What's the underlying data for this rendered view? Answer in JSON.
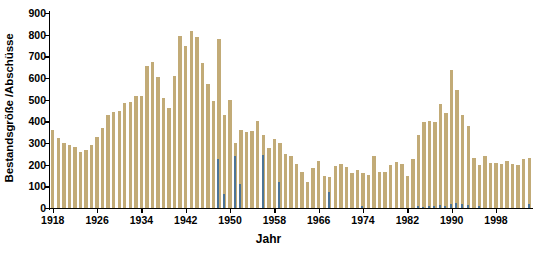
{
  "chart_data": {
    "type": "bar",
    "title": "",
    "subtitle": "",
    "xlabel": "Jahr",
    "ylabel": "Bestandsgröße /Abschüsse",
    "ylim": [
      0,
      900
    ],
    "ytick_step": 100,
    "yticks": [
      0,
      100,
      200,
      300,
      400,
      500,
      600,
      700,
      800,
      900
    ],
    "xlim": [
      1917.5,
      2004.5
    ],
    "xticks": [
      1918,
      1926,
      1934,
      1942,
      1950,
      1958,
      1966,
      1974,
      1982,
      1990,
      1998
    ],
    "xtick_labels": [
      "1918",
      "1926",
      "1934",
      "1942",
      "1950",
      "1958",
      "1966",
      "1974",
      "1982",
      "1990",
      "1998"
    ],
    "grid": false,
    "legend": "none",
    "colors": {
      "primary": "#c2ab77",
      "secondary": "#4c7496",
      "axis": "#000000",
      "background": "#ffffff"
    },
    "categories": [
      1918,
      1919,
      1920,
      1921,
      1922,
      1923,
      1924,
      1925,
      1926,
      1927,
      1928,
      1929,
      1930,
      1931,
      1932,
      1933,
      1934,
      1935,
      1936,
      1937,
      1938,
      1939,
      1940,
      1941,
      1942,
      1943,
      1944,
      1945,
      1946,
      1947,
      1948,
      1949,
      1950,
      1951,
      1952,
      1953,
      1954,
      1955,
      1956,
      1957,
      1958,
      1959,
      1960,
      1961,
      1962,
      1963,
      1964,
      1965,
      1966,
      1967,
      1968,
      1969,
      1970,
      1971,
      1972,
      1973,
      1974,
      1975,
      1976,
      1977,
      1978,
      1979,
      1980,
      1981,
      1982,
      1983,
      1984,
      1985,
      1986,
      1987,
      1988,
      1989,
      1990,
      1991,
      1992,
      1993,
      1994,
      1995,
      1996,
      1997,
      1998,
      1999,
      2000,
      2001,
      2002,
      2003,
      2004
    ],
    "series": [
      {
        "name": "Bestandsgröße",
        "color": "#c2ab77",
        "values": [
          360,
          325,
          298,
          292,
          282,
          258,
          268,
          292,
          330,
          368,
          428,
          443,
          447,
          483,
          488,
          518,
          518,
          655,
          672,
          605,
          508,
          460,
          610,
          795,
          748,
          818,
          788,
          668,
          572,
          492,
          778,
          430,
          498,
          300,
          360,
          350,
          355,
          400,
          338,
          275,
          318,
          300,
          250,
          238,
          205,
          168,
          120,
          185,
          218,
          150,
          142,
          192,
          205,
          190,
          160,
          175,
          160,
          152,
          240,
          165,
          168,
          200,
          212,
          205,
          148,
          225,
          335,
          395,
          400,
          398,
          480,
          438,
          635,
          545,
          428,
          378,
          230,
          200,
          242,
          208,
          210,
          205,
          218,
          205,
          198,
          228,
          230
        ]
      },
      {
        "name": "Abschüsse",
        "color": "#4c7496",
        "values": [
          0,
          0,
          0,
          0,
          0,
          0,
          0,
          0,
          0,
          0,
          0,
          0,
          0,
          0,
          0,
          0,
          0,
          0,
          0,
          0,
          0,
          0,
          0,
          0,
          0,
          0,
          0,
          0,
          0,
          0,
          228,
          65,
          0,
          240,
          112,
          0,
          0,
          0,
          245,
          0,
          0,
          118,
          0,
          0,
          0,
          0,
          0,
          0,
          0,
          0,
          72,
          0,
          0,
          0,
          0,
          0,
          10,
          0,
          0,
          0,
          0,
          0,
          0,
          0,
          0,
          0,
          8,
          6,
          10,
          8,
          14,
          8,
          20,
          22,
          20,
          15,
          0,
          8,
          0,
          0,
          0,
          0,
          0,
          0,
          0,
          0,
          18
        ]
      }
    ]
  }
}
